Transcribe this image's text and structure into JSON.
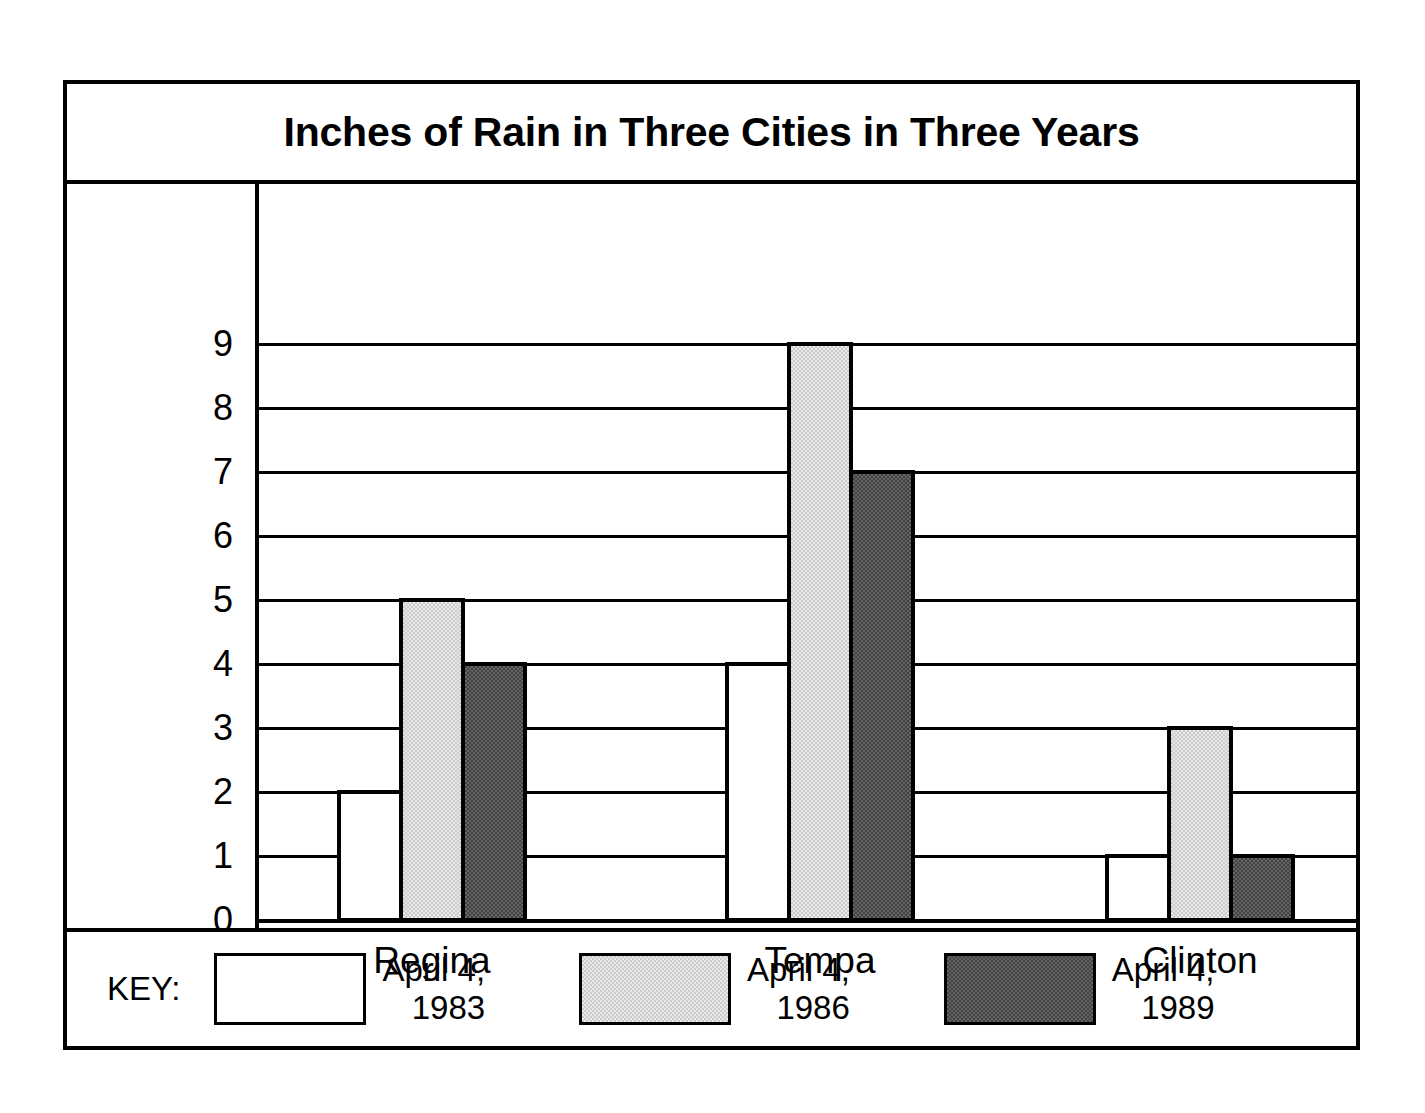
{
  "chart_data": {
    "type": "bar",
    "title": "Inches of Rain in Three Cities in Three Years",
    "xlabel": "",
    "ylabel": "",
    "categories": [
      "Regina",
      "Tempa",
      "Clinton"
    ],
    "series": [
      {
        "name": "April 4, 1983",
        "values": [
          2,
          4,
          1
        ],
        "fill": "white"
      },
      {
        "name": "April 4, 1986",
        "values": [
          5,
          9,
          3
        ],
        "fill": "light-gray"
      },
      {
        "name": "April 4, 1989",
        "values": [
          4,
          7,
          1
        ],
        "fill": "dark-gray"
      }
    ],
    "ylim": [
      0,
      9
    ],
    "ytick_labels": [
      "0",
      "1",
      "2",
      "3",
      "4",
      "5",
      "6",
      "7",
      "8",
      "9"
    ],
    "ytick_values": [
      0,
      1,
      2,
      3,
      4,
      5,
      6,
      7,
      8,
      9
    ],
    "grid": true,
    "legend_position": "bottom",
    "legend_title": "KEY:",
    "colors": {
      "bar_outline": "#000000",
      "series_1983": "#ffffff",
      "series_1986": "#cbcbcb",
      "series_1989": "#444444",
      "frame": "#000000",
      "background": "#ffffff",
      "text": "#000000"
    }
  },
  "legend": {
    "label": "KEY:",
    "entries": [
      {
        "line1": "April 4,",
        "line2": "1983",
        "fill": "white"
      },
      {
        "line1": "April 4,",
        "line2": "1986",
        "fill": "light-gray"
      },
      {
        "line1": "April 4,",
        "line2": "1989",
        "fill": "dark-gray"
      }
    ]
  }
}
